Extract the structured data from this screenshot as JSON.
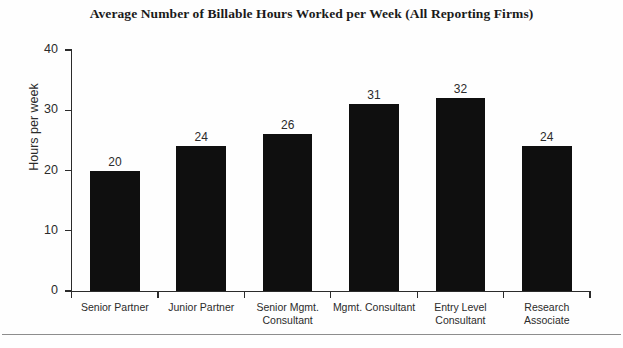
{
  "chart_data": {
    "type": "bar",
    "title": "Average Number of Billable Hours Worked per Week (All Reporting Firms)",
    "xlabel": "",
    "ylabel": "Hours per week",
    "categories": [
      "Senior Partner",
      "Junior Partner",
      "Senior Mgmt. Consultant",
      "Mgmt. Consultant",
      "Entry Level Consultant",
      "Research Associate"
    ],
    "category_lines": [
      [
        "Senior Partner"
      ],
      [
        "Junior Partner"
      ],
      [
        "Senior Mgmt.",
        "Consultant"
      ],
      [
        "Mgmt. Consultant"
      ],
      [
        "Entry Level",
        "Consultant"
      ],
      [
        "Research",
        "Associate"
      ]
    ],
    "values": [
      20,
      24,
      26,
      31,
      32,
      24
    ],
    "value_labels": [
      "20",
      "24",
      "26",
      "31",
      "32",
      "24"
    ],
    "ylim": [
      0,
      40
    ],
    "yticks": [
      0,
      10,
      20,
      30,
      40
    ],
    "ytick_labels": [
      "0",
      "10",
      "20",
      "30",
      "40"
    ],
    "grid": false,
    "legend": false,
    "bar_color": "#0f0f0f",
    "axis_color": "#2b2b2b",
    "background_color": "#fefefe"
  }
}
